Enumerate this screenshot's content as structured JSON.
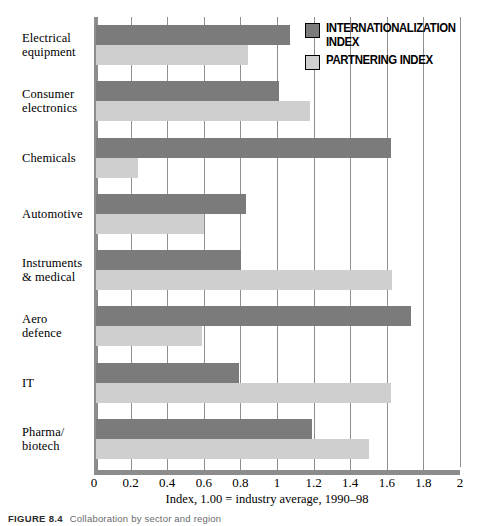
{
  "chart_data": {
    "type": "bar",
    "orientation": "horizontal",
    "title": "",
    "xlabel": "Index, 1.00 = industry average, 1990–98",
    "ylabel": "",
    "xlim": [
      0,
      2
    ],
    "xticks": [
      0,
      0.2,
      0.4,
      0.6,
      0.8,
      1,
      1.2,
      1.4,
      1.6,
      1.8,
      2
    ],
    "xticklabels": [
      "0",
      "0.2",
      "0.4",
      "0.6",
      "0.8",
      "1",
      "1.2",
      "1.4",
      "1.6",
      "1.8",
      "2"
    ],
    "grid": true,
    "grid_axis": "x",
    "legend_position": "top-right",
    "categories": [
      "Electrical equipment",
      "Consumer electronics",
      "Chemicals",
      "Automotive",
      "Instruments & medical",
      "Aero defence",
      "IT",
      "Pharma/ biotech"
    ],
    "series": [
      {
        "name": "INTERNATIONALIZATION INDEX",
        "color": "#7b7b7b",
        "values": [
          1.06,
          1.0,
          1.61,
          0.82,
          0.79,
          1.72,
          0.78,
          1.18
        ]
      },
      {
        "name": "PARTNERING INDEX",
        "color": "#cfcfcf",
        "values": [
          0.83,
          1.17,
          0.23,
          0.59,
          1.62,
          0.58,
          1.61,
          1.49
        ]
      }
    ]
  },
  "categories_display": [
    {
      "line1": "Electrical",
      "line2": "equipment"
    },
    {
      "line1": "Consumer",
      "line2": "electronics"
    },
    {
      "line1": "Chemicals",
      "line2": ""
    },
    {
      "line1": "Automotive",
      "line2": ""
    },
    {
      "line1": "Instruments",
      "line2": "& medical"
    },
    {
      "line1": "Aero",
      "line2": "defence"
    },
    {
      "line1": "IT",
      "line2": ""
    },
    {
      "line1": "Pharma/",
      "line2": "biotech"
    }
  ],
  "legend": {
    "items": [
      {
        "label_line1": "INTERNATIONALIZATION",
        "label_line2": "INDEX",
        "swatch": "internationalization"
      },
      {
        "label_line1": "PARTNERING INDEX",
        "label_line2": "",
        "swatch": "partnering"
      }
    ]
  },
  "axis": {
    "x_title": "Index, 1.00 = industry average, 1990–98"
  },
  "caption": {
    "id": "FIGURE 8.4",
    "text": "Collaboration by sector and region"
  },
  "colors": {
    "internationalization": "#7b7b7b",
    "partnering": "#cfcfcf",
    "axis": "#8c8c8c",
    "grid": "#8f8f8f"
  }
}
